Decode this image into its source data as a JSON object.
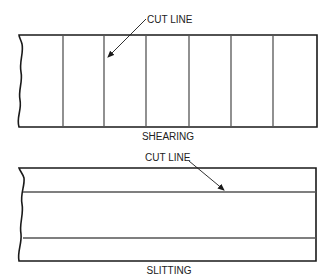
{
  "diagrams": [
    {
      "name": "shearing",
      "caption": "SHEARING",
      "callout": "CUT LINE",
      "cut_orientation": "vertical",
      "cut_count": 6
    },
    {
      "name": "slitting",
      "caption": "SLITTING",
      "callout": "CUT LINE",
      "cut_orientation": "horizontal",
      "cut_count": 2
    }
  ],
  "colors": {
    "line": "#1a1a1a",
    "cut": "#555555",
    "background": "#ffffff"
  }
}
